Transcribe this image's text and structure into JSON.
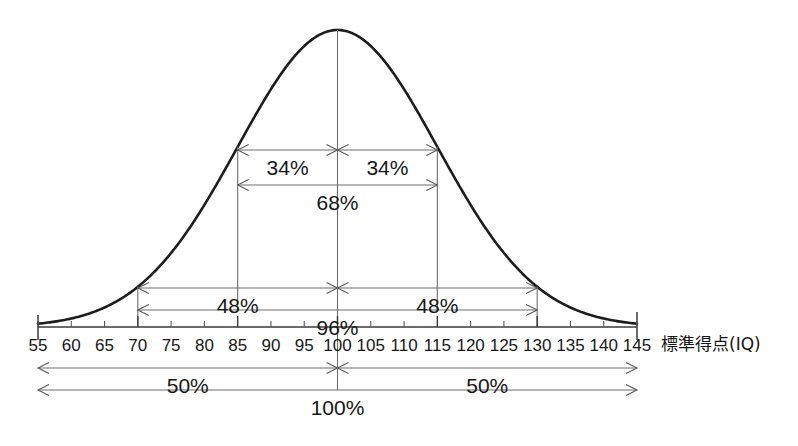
{
  "chart_data": {
    "type": "line",
    "title": "",
    "subtitle": "",
    "xlabel": "標準得点(IQ)",
    "ylabel": "",
    "xlim": [
      55,
      145
    ],
    "ylim": [
      0,
      1
    ],
    "grid": false,
    "legend": null,
    "distribution": {
      "kind": "normal",
      "mean": 100,
      "sd": 15
    },
    "x_ticks": [
      55,
      60,
      65,
      70,
      75,
      80,
      85,
      90,
      95,
      100,
      105,
      110,
      115,
      120,
      125,
      130,
      135,
      140,
      145
    ],
    "x_tick_labels": [
      "55",
      "60",
      "65",
      "70",
      "75",
      "80",
      "85",
      "90",
      "95",
      "100",
      "105",
      "110",
      "115",
      "120",
      "125",
      "130",
      "135",
      "140",
      "145"
    ],
    "major_ticks": [
      70,
      85,
      100,
      115,
      130
    ],
    "x": [
      55,
      60,
      65,
      70,
      75,
      80,
      85,
      90,
      95,
      100,
      105,
      110,
      115,
      120,
      125,
      130,
      135,
      140,
      145
    ],
    "y": [
      0.001,
      0.004,
      0.011,
      0.029,
      0.063,
      0.135,
      0.249,
      0.411,
      0.641,
      1.0,
      0.641,
      0.411,
      0.249,
      0.135,
      0.063,
      0.029,
      0.011,
      0.004,
      0.001
    ],
    "annotations": [
      {
        "id": "left-34",
        "label": "34%",
        "from": 85,
        "to": 100,
        "row": 1
      },
      {
        "id": "right-34",
        "label": "34%",
        "from": 100,
        "to": 115,
        "row": 1
      },
      {
        "id": "span-68",
        "label": "68%",
        "from": 85,
        "to": 115,
        "row": 2
      },
      {
        "id": "left-48",
        "label": "48%",
        "from": 70,
        "to": 100,
        "row": 3
      },
      {
        "id": "right-48",
        "label": "48%",
        "from": 100,
        "to": 130,
        "row": 3
      },
      {
        "id": "span-96",
        "label": "96%",
        "from": 70,
        "to": 130,
        "row": 4
      },
      {
        "id": "left-50",
        "label": "50%",
        "from": 55,
        "to": 100,
        "row": 5
      },
      {
        "id": "right-50",
        "label": "50%",
        "from": 100,
        "to": 145,
        "row": 5
      },
      {
        "id": "span-100",
        "label": "100%",
        "from": 55,
        "to": 145,
        "row": 6
      }
    ]
  },
  "axis": {
    "title": "標準得点(IQ)",
    "tick_labels": [
      "55",
      "60",
      "65",
      "70",
      "75",
      "80",
      "85",
      "90",
      "95",
      "100",
      "105",
      "110",
      "115",
      "120",
      "125",
      "130",
      "135",
      "140",
      "145"
    ]
  },
  "labels": {
    "pct_34_left": "34%",
    "pct_34_right": "34%",
    "pct_68": "68%",
    "pct_48_left": "48%",
    "pct_48_right": "48%",
    "pct_96": "96%",
    "pct_50_left": "50%",
    "pct_50_right": "50%",
    "pct_100": "100%"
  },
  "colors": {
    "curve": "#1d1d1d",
    "axis": "#3a3a3a",
    "dimension": "#6e6e6e",
    "text": "#171717",
    "background": "#ffffff"
  }
}
